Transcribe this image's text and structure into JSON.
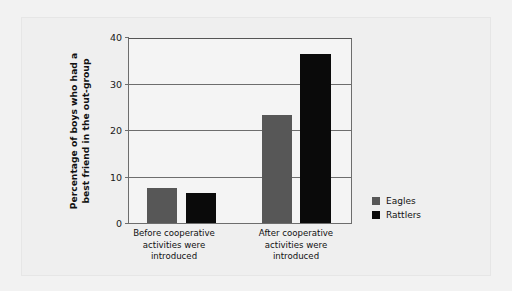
{
  "chart_data": {
    "type": "bar",
    "title": "",
    "subtitle": "",
    "xlabel": "",
    "ylabel": "Percentage of boys who had a best friend in the out-group",
    "ylabel_lines": [
      "Percentage of boys who had a",
      "best friend in the out-group"
    ],
    "categories": [
      "Before cooperative activities were introduced",
      "After cooperative activities were introduced"
    ],
    "category_lines": [
      [
        "Before cooperative",
        "activities were",
        "introduced"
      ],
      [
        "After cooperative",
        "activities were",
        "introduced"
      ]
    ],
    "series": [
      {
        "name": "Eagles",
        "color": "#575757",
        "values": [
          7.5,
          23.2
        ]
      },
      {
        "name": "Rattlers",
        "color": "#0a0a0a",
        "values": [
          6.4,
          36.3
        ]
      }
    ],
    "ylim": [
      0,
      40
    ],
    "yticks": [
      0,
      10,
      20,
      30,
      40
    ],
    "ytick_labels": [
      "0",
      "10",
      "20",
      "30",
      "40"
    ],
    "grid": true,
    "legend_position": "right",
    "legend": [
      "Eagles",
      "Rattlers"
    ]
  },
  "figure": {
    "background_color": "#f2f2f2",
    "panel_color": "#efefef",
    "axis_color": "#6d6d6d"
  }
}
